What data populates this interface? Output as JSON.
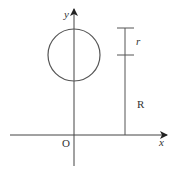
{
  "diagram": {
    "labels": {
      "y_axis": "y",
      "x_axis": "x",
      "origin": "O",
      "small_radius": "r",
      "large_radius": "R"
    },
    "colors": {
      "stroke": "#444444",
      "circle": "#555555",
      "text": "#333333",
      "background": "#ffffff"
    }
  }
}
